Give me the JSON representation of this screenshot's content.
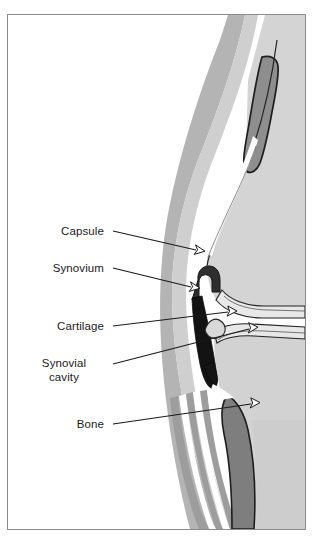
{
  "figure": {
    "background_color": "#ffffff",
    "frame_color": "#8c8c8c",
    "palette": {
      "bone_light": "#d2d2d2",
      "bone_mid": "#c4c4c4",
      "muscle_mid": "#b3b3b3",
      "muscle_dark": "#9a9a9a",
      "tissue_grey": "#a8a8a8",
      "cartilage_light": "#e6e6e6",
      "synovium_dark": "#3a3a3a",
      "cavity_black": "#111111",
      "outline": "#222222",
      "white": "#ffffff"
    }
  },
  "labels": [
    {
      "id": "capsule",
      "text": "Capsule",
      "lines": [
        "Capsule"
      ],
      "text_x": 104,
      "text_y": 226,
      "align": "right",
      "leader_start_x": 113,
      "leader_start_y": 231,
      "arrow_tip_x": 204,
      "arrow_tip_y": 251,
      "points_to": "joint capsule outer membrane"
    },
    {
      "id": "synovium",
      "text": "Synovium",
      "lines": [
        "Synovium"
      ],
      "text_x": 104,
      "text_y": 263,
      "align": "right",
      "leader_start_x": 113,
      "leader_start_y": 268,
      "arrow_tip_x": 199,
      "arrow_tip_y": 288,
      "points_to": "synovial membrane lining"
    },
    {
      "id": "cartilage",
      "text": "Cartilage",
      "lines": [
        "Cartilage"
      ],
      "text_x": 104,
      "text_y": 321,
      "align": "right",
      "leader_start_x": 113,
      "leader_start_y": 326,
      "arrow_tip_x": 236,
      "arrow_tip_y": 311,
      "points_to": "articular cartilage surface"
    },
    {
      "id": "synovial-cavity",
      "text": "Synovial cavity",
      "lines": [
        "Synovial",
        "cavity"
      ],
      "text_x": 104,
      "text_y": 358,
      "align": "center",
      "leader_start_x": 113,
      "leader_start_y": 364,
      "arrow_tip_x": 257,
      "arrow_tip_y": 327,
      "points_to": "fluid-filled joint space"
    },
    {
      "id": "bone",
      "text": "Bone",
      "lines": [
        "Bone"
      ],
      "text_x": 104,
      "text_y": 419,
      "align": "right",
      "leader_start_x": 113,
      "leader_start_y": 424,
      "arrow_tip_x": 259,
      "arrow_tip_y": 402,
      "points_to": "bone body"
    }
  ],
  "anatomy": {
    "structures": [
      "upper bone shaft",
      "lower bone shaft",
      "articular cartilage",
      "synovial membrane",
      "synovial cavity",
      "joint capsule",
      "surrounding muscle tissue",
      "tendon band"
    ]
  }
}
